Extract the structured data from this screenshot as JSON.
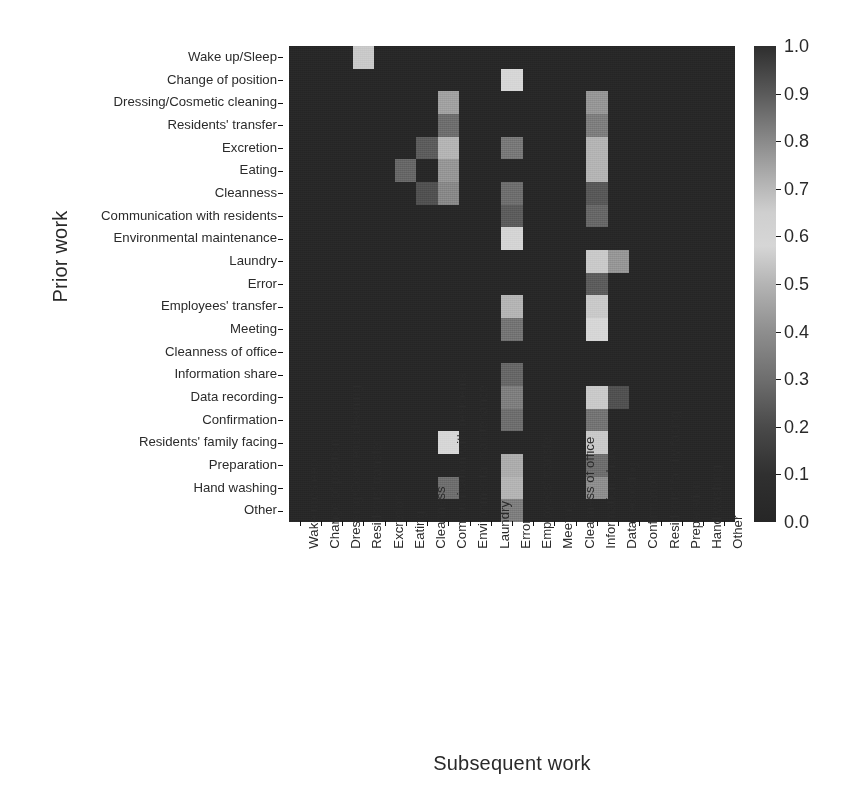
{
  "figure": {
    "ylabel": "Prior work",
    "xlabel": "Subsequent work"
  },
  "chart_data": {
    "type": "heatmap",
    "title": "",
    "xlabel": "Subsequent work",
    "ylabel": "Prior work",
    "grid": false,
    "legend_position": "right",
    "colorbar": {
      "label": "",
      "ticks": [
        "0.0",
        "0.1",
        "0.2",
        "0.3",
        "0.4",
        "0.5",
        "0.6",
        "0.7",
        "0.8",
        "0.9",
        "1.0"
      ],
      "tick_values": [
        0.0,
        0.1,
        0.2,
        0.3,
        0.4,
        0.5,
        0.6,
        0.7,
        0.8,
        0.9,
        1.0
      ],
      "vmin": 0.0,
      "vmax": 1.0,
      "colormap": "grayscale-nonmonotonic",
      "stops": [
        {
          "v": 0.0,
          "hex": "#262626"
        },
        {
          "v": 0.1,
          "hex": "#303030"
        },
        {
          "v": 0.2,
          "hex": "#4a4a4a"
        },
        {
          "v": 0.3,
          "hex": "#6e6e6e"
        },
        {
          "v": 0.4,
          "hex": "#8e8e8e"
        },
        {
          "v": 0.5,
          "hex": "#b4b4b4"
        },
        {
          "v": 0.58,
          "hex": "#d6d6d6"
        },
        {
          "v": 0.65,
          "hex": "#cfcfcf"
        },
        {
          "v": 0.72,
          "hex": "#b0b0b0"
        },
        {
          "v": 0.8,
          "hex": "#8a8a8a"
        },
        {
          "v": 0.9,
          "hex": "#5a5a5a"
        },
        {
          "v": 1.0,
          "hex": "#2e2e2e"
        }
      ]
    },
    "x_categories": [
      "Wake up/Sleep",
      "Change of position",
      "Dressing/Cosmetic cleaning",
      "Residents' transfer",
      "Excretion",
      "Eating",
      "Cleanness",
      "Communication with residents",
      "Environmental maintenance",
      "Laundry",
      "Error",
      "Employees' transfer",
      "Meeting",
      "Cleanness of office",
      "Information share",
      "Data recording",
      "Confirmation",
      "Residents' family facing",
      "Preparation",
      "Hand washing",
      "Other"
    ],
    "y_categories": [
      "Wake up/Sleep",
      "Change of position",
      "Dressing/Cosmetic cleaning",
      "Residents' transfer",
      "Excretion",
      "Eating",
      "Cleanness",
      "Communication with residents",
      "Environmental maintenance",
      "Laundry",
      "Error",
      "Employees' transfer",
      "Meeting",
      "Cleanness of office",
      "Information share",
      "Data recording",
      "Confirmation",
      "Residents' family facing",
      "Preparation",
      "Hand washing",
      "Other"
    ],
    "values": [
      [
        0.02,
        0.02,
        0.02,
        0.55,
        0.02,
        0.02,
        0.02,
        0.02,
        0.02,
        0.02,
        0.02,
        0.02,
        0.02,
        0.02,
        0.02,
        0.02,
        0.02,
        0.02,
        0.02,
        0.02,
        0.02
      ],
      [
        0.02,
        0.02,
        0.02,
        0.02,
        0.02,
        0.02,
        0.02,
        0.02,
        0.02,
        0.02,
        0.58,
        0.02,
        0.02,
        0.02,
        0.02,
        0.02,
        0.02,
        0.02,
        0.02,
        0.02,
        0.02
      ],
      [
        0.02,
        0.02,
        0.02,
        0.02,
        0.02,
        0.02,
        0.02,
        0.45,
        0.02,
        0.02,
        0.02,
        0.02,
        0.02,
        0.02,
        0.42,
        0.02,
        0.02,
        0.02,
        0.02,
        0.02,
        0.02
      ],
      [
        0.02,
        0.02,
        0.02,
        0.02,
        0.02,
        0.02,
        0.02,
        0.3,
        0.02,
        0.02,
        0.02,
        0.02,
        0.02,
        0.02,
        0.35,
        0.02,
        0.02,
        0.02,
        0.02,
        0.02,
        0.02
      ],
      [
        0.02,
        0.02,
        0.02,
        0.02,
        0.02,
        0.02,
        0.25,
        0.5,
        0.02,
        0.02,
        0.33,
        0.02,
        0.02,
        0.02,
        0.5,
        0.02,
        0.02,
        0.02,
        0.02,
        0.02,
        0.02
      ],
      [
        0.02,
        0.02,
        0.02,
        0.02,
        0.02,
        0.28,
        0.02,
        0.42,
        0.02,
        0.02,
        0.02,
        0.02,
        0.02,
        0.02,
        0.5,
        0.02,
        0.02,
        0.02,
        0.02,
        0.02,
        0.02
      ],
      [
        0.02,
        0.02,
        0.02,
        0.02,
        0.02,
        0.02,
        0.22,
        0.38,
        0.02,
        0.02,
        0.3,
        0.02,
        0.02,
        0.02,
        0.24,
        0.02,
        0.02,
        0.02,
        0.02,
        0.02,
        0.02
      ],
      [
        0.02,
        0.02,
        0.02,
        0.02,
        0.02,
        0.02,
        0.02,
        0.02,
        0.02,
        0.02,
        0.25,
        0.02,
        0.02,
        0.02,
        0.28,
        0.02,
        0.02,
        0.02,
        0.02,
        0.02,
        0.02
      ],
      [
        0.02,
        0.02,
        0.02,
        0.02,
        0.02,
        0.02,
        0.02,
        0.02,
        0.02,
        0.02,
        0.6,
        0.02,
        0.02,
        0.02,
        0.02,
        0.02,
        0.02,
        0.02,
        0.02,
        0.02,
        0.02
      ],
      [
        0.02,
        0.02,
        0.02,
        0.02,
        0.02,
        0.02,
        0.02,
        0.02,
        0.02,
        0.02,
        0.02,
        0.02,
        0.02,
        0.02,
        0.55,
        0.42,
        0.02,
        0.02,
        0.02,
        0.02,
        0.02
      ],
      [
        0.02,
        0.02,
        0.02,
        0.02,
        0.02,
        0.02,
        0.02,
        0.02,
        0.02,
        0.02,
        0.02,
        0.02,
        0.02,
        0.02,
        0.25,
        0.02,
        0.02,
        0.02,
        0.02,
        0.02,
        0.02
      ],
      [
        0.02,
        0.02,
        0.02,
        0.02,
        0.02,
        0.02,
        0.02,
        0.02,
        0.02,
        0.02,
        0.5,
        0.02,
        0.02,
        0.02,
        0.55,
        0.02,
        0.02,
        0.02,
        0.02,
        0.02,
        0.02
      ],
      [
        0.02,
        0.02,
        0.02,
        0.02,
        0.02,
        0.02,
        0.02,
        0.02,
        0.02,
        0.02,
        0.32,
        0.02,
        0.02,
        0.02,
        0.58,
        0.02,
        0.02,
        0.02,
        0.02,
        0.02,
        0.02
      ],
      [
        0.02,
        0.02,
        0.02,
        0.02,
        0.02,
        0.02,
        0.02,
        0.02,
        0.02,
        0.02,
        0.02,
        0.02,
        0.02,
        0.02,
        0.02,
        0.02,
        0.02,
        0.02,
        0.02,
        0.02,
        0.02
      ],
      [
        0.02,
        0.02,
        0.02,
        0.02,
        0.02,
        0.02,
        0.02,
        0.02,
        0.02,
        0.02,
        0.28,
        0.02,
        0.02,
        0.02,
        0.02,
        0.02,
        0.02,
        0.02,
        0.02,
        0.02,
        0.02
      ],
      [
        0.02,
        0.02,
        0.02,
        0.02,
        0.02,
        0.02,
        0.02,
        0.02,
        0.02,
        0.02,
        0.35,
        0.02,
        0.02,
        0.02,
        0.55,
        0.22,
        0.02,
        0.02,
        0.02,
        0.02,
        0.02
      ],
      [
        0.02,
        0.02,
        0.02,
        0.02,
        0.02,
        0.02,
        0.02,
        0.02,
        0.02,
        0.02,
        0.3,
        0.02,
        0.02,
        0.02,
        0.32,
        0.02,
        0.02,
        0.02,
        0.02,
        0.02,
        0.02
      ],
      [
        0.02,
        0.02,
        0.02,
        0.02,
        0.02,
        0.02,
        0.02,
        0.58,
        0.02,
        0.02,
        0.02,
        0.02,
        0.02,
        0.02,
        0.55,
        0.02,
        0.02,
        0.02,
        0.02,
        0.02,
        0.02
      ],
      [
        0.02,
        0.02,
        0.02,
        0.02,
        0.02,
        0.02,
        0.02,
        0.02,
        0.02,
        0.02,
        0.48,
        0.02,
        0.02,
        0.02,
        0.3,
        0.02,
        0.02,
        0.02,
        0.02,
        0.02,
        0.02
      ],
      [
        0.02,
        0.02,
        0.02,
        0.02,
        0.02,
        0.02,
        0.02,
        0.3,
        0.02,
        0.02,
        0.5,
        0.02,
        0.02,
        0.02,
        0.4,
        0.02,
        0.02,
        0.02,
        0.02,
        0.02,
        0.02
      ],
      [
        0.02,
        0.02,
        0.02,
        0.02,
        0.02,
        0.02,
        0.02,
        0.02,
        0.02,
        0.02,
        0.35,
        0.02,
        0.02,
        0.02,
        0.02,
        0.02,
        0.02,
        0.02,
        0.02,
        0.02,
        0.02
      ]
    ]
  }
}
